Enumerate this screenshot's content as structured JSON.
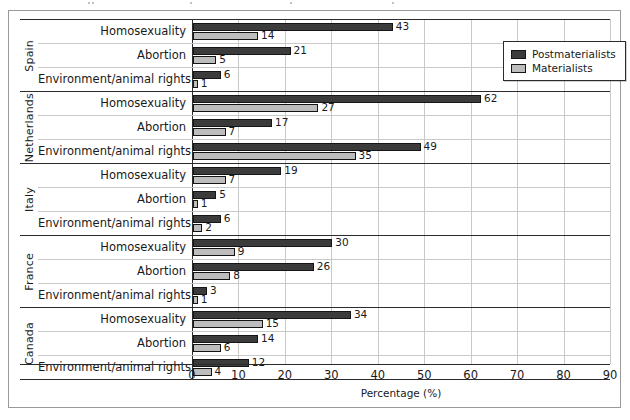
{
  "legend": {
    "position": "top-right",
    "items": [
      {
        "label": "Postmaterialists",
        "color": "#3b3b3b",
        "key": "postmaterialists"
      },
      {
        "label": "Materialists",
        "color": "#bdbdbd",
        "key": "materialists"
      }
    ]
  },
  "axis": {
    "x_title": "Percentage (%)",
    "x_ticks": [
      "0",
      "10",
      "20",
      "30",
      "40",
      "50",
      "60",
      "70",
      "80",
      "90"
    ]
  },
  "chart_data": {
    "type": "bar",
    "orientation": "horizontal",
    "title": "",
    "xlabel": "Percentage (%)",
    "ylabel": "",
    "xlim": [
      0,
      90
    ],
    "xticks": [
      0,
      10,
      20,
      30,
      40,
      50,
      60,
      70,
      80,
      90
    ],
    "grid": true,
    "legend_position": "top-right",
    "group_field": "country",
    "categories": [
      "Homosexuality",
      "Abortion",
      "Environment/animal rights"
    ],
    "series": [
      {
        "name": "Postmaterialists",
        "color": "#3b3b3b"
      },
      {
        "name": "Materialists",
        "color": "#bdbdbd"
      }
    ],
    "groups": [
      {
        "country": "Spain",
        "rows": [
          {
            "label": "Homosexuality",
            "postmaterialists": 43,
            "materialists": 14
          },
          {
            "label": "Abortion",
            "postmaterialists": 21,
            "materialists": 5
          },
          {
            "label": "Environment/animal rights",
            "postmaterialists": 6,
            "materialists": 1
          }
        ]
      },
      {
        "country": "Netherlands",
        "rows": [
          {
            "label": "Homosexuality",
            "postmaterialists": 62,
            "materialists": 27
          },
          {
            "label": "Abortion",
            "postmaterialists": 17,
            "materialists": 7
          },
          {
            "label": "Environment/animal rights",
            "postmaterialists": 49,
            "materialists": 35
          }
        ]
      },
      {
        "country": "Italy",
        "rows": [
          {
            "label": "Homosexuality",
            "postmaterialists": 19,
            "materialists": 7
          },
          {
            "label": "Abortion",
            "postmaterialists": 5,
            "materialists": 1
          },
          {
            "label": "Environment/animal rights",
            "postmaterialists": 6,
            "materialists": 2
          }
        ]
      },
      {
        "country": "France",
        "rows": [
          {
            "label": "Homosexuality",
            "postmaterialists": 30,
            "materialists": 9
          },
          {
            "label": "Abortion",
            "postmaterialists": 26,
            "materialists": 8
          },
          {
            "label": "Environment/animal rights",
            "postmaterialists": 3,
            "materialists": 1
          }
        ]
      },
      {
        "country": "Canada",
        "rows": [
          {
            "label": "Homosexuality",
            "postmaterialists": 34,
            "materialists": 15
          },
          {
            "label": "Abortion",
            "postmaterialists": 14,
            "materialists": 6
          },
          {
            "label": "Environment/animal rights",
            "postmaterialists": 12,
            "materialists": 4
          }
        ]
      }
    ]
  }
}
